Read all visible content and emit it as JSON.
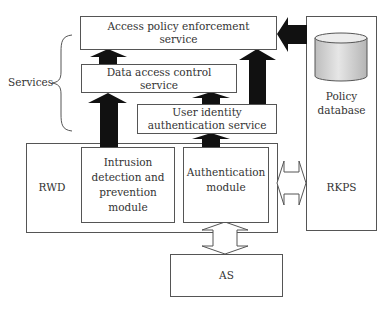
{
  "diagram": {
    "services_label": "Services",
    "boxes": {
      "access_policy": {
        "line1": "Access policy enforcement",
        "line2": "service"
      },
      "data_access": {
        "line1": "Data access control",
        "line2": "service"
      },
      "user_identity": {
        "line1": "User identity",
        "line2": "authentication service"
      },
      "rwd": {
        "label": "RWD"
      },
      "intrusion": {
        "line1": "Intrusion",
        "line2": "detection and",
        "line3": "prevention",
        "line4": "module"
      },
      "auth_module": {
        "line1": "Authentication",
        "line2": "module"
      },
      "rkps": {
        "label": "RKPS"
      },
      "policy_db": {
        "line1": "Policy",
        "line2": "database"
      },
      "as": {
        "label": "AS"
      }
    },
    "colors": {
      "border": "#555555",
      "arrow_fill": "#111111",
      "cylinder_fill": "#d9d9d9",
      "text": "#333333"
    }
  }
}
